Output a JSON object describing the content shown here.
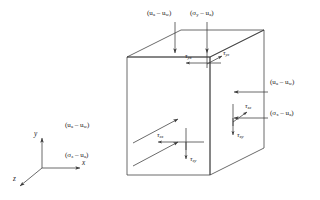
{
  "figure": {
    "background_color": "#ffffff",
    "line_color": "#3a3a3a",
    "text_color": "#1a1a1a"
  },
  "axes": {
    "y_label": "y",
    "x_label": "x",
    "z_label": "z"
  },
  "top_face": {
    "pore_pressure_label_a": "(u",
    "pore_pressure_sub_a": "a",
    "pore_pressure_label_b": " – u",
    "pore_pressure_sub_b": "w",
    "pore_pressure_label_c": ")",
    "normal_stress_label_a": "(σ",
    "normal_stress_sub_a": "y",
    "normal_stress_label_b": " – u",
    "normal_stress_sub_b": "a",
    "normal_stress_label_c": ")",
    "shear_1_symbol": "τ",
    "shear_1_sub": "yx",
    "shear_2_symbol": "τ",
    "shear_2_sub": "yz"
  },
  "right_face": {
    "pore_pressure_label_a": "(u",
    "pore_pressure_sub_a": "a",
    "pore_pressure_label_b": " – u",
    "pore_pressure_sub_b": "w",
    "pore_pressure_label_c": ")",
    "normal_stress_label_a": "(σ",
    "normal_stress_sub_a": "x",
    "normal_stress_label_b": " – u",
    "normal_stress_sub_b": "a",
    "normal_stress_label_c": ")",
    "shear_1_symbol": "τ",
    "shear_1_sub": "xz",
    "shear_2_symbol": "τ",
    "shear_2_sub": "xy"
  },
  "front_face": {
    "pore_pressure_label_a": "(u",
    "pore_pressure_sub_a": "a",
    "pore_pressure_label_b": " – u",
    "pore_pressure_sub_b": "w",
    "pore_pressure_label_c": ")",
    "normal_stress_label_a": "(σ",
    "normal_stress_sub_a": "z",
    "normal_stress_label_b": " – u",
    "normal_stress_sub_b": "a",
    "normal_stress_label_c": ")",
    "shear_1_symbol": "τ",
    "shear_1_sub": "zx",
    "shear_2_symbol": "τ",
    "shear_2_sub": "zy"
  }
}
